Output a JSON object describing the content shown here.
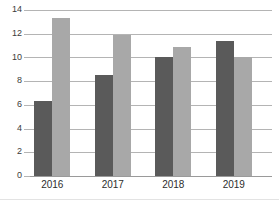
{
  "chart_data": {
    "type": "bar",
    "title": "",
    "subtitle": "",
    "xlabel": "",
    "ylabel": "",
    "categories": [
      "2016",
      "2017",
      "2018",
      "2019"
    ],
    "series": [
      {
        "name": "Series 1",
        "color": "#5a5a5a",
        "values": [
          6.3,
          8.5,
          10.0,
          11.4
        ]
      },
      {
        "name": "Series 2",
        "color": "#a8a8a8",
        "values": [
          13.3,
          11.9,
          10.85,
          10.0
        ]
      }
    ],
    "ylim": [
      0,
      14
    ],
    "yticks": [
      0,
      2,
      4,
      6,
      8,
      10,
      12,
      14
    ],
    "ytick_labels": [
      "0",
      "2",
      "4",
      "6",
      "8",
      "10",
      "12",
      "14"
    ],
    "grid": true,
    "grid_axis": "y",
    "legend": false,
    "legend_position": "none"
  },
  "axis": {
    "y_label_0": "0",
    "y_label_2": "2",
    "y_label_4": "4",
    "y_label_6": "6",
    "y_label_8": "8",
    "y_label_10": "10",
    "y_label_12": "12",
    "y_label_14": "14"
  },
  "xaxis": {
    "cat_0": "2016",
    "cat_1": "2017",
    "cat_2": "2018",
    "cat_3": "2019"
  },
  "colors": {
    "series_1": "#5a5a5a",
    "series_2": "#a8a8a8",
    "gridline": "#b4b4b4",
    "tick_text": "#3c3c3c"
  }
}
